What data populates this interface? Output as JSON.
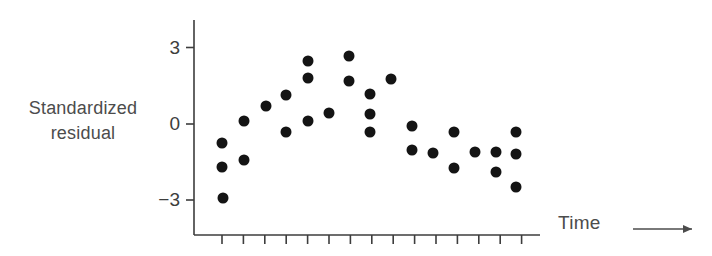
{
  "figure": {
    "background_color": "#ffffff",
    "ink_color": "#141414",
    "text_color": "#4c4c4c",
    "axis_color": "#3d3d3d",
    "ylabel_line1": "Standardized",
    "ylabel_line2": "residual",
    "xlabel": "Time",
    "arrow_icon": "right-arrow-icon"
  },
  "axes": {
    "y_ticks": [
      {
        "label": "3",
        "value": 3,
        "py": 47.5
      },
      {
        "label": "0",
        "value": 0,
        "py": 124
      },
      {
        "label": "-3",
        "value": -3,
        "py": 200
      }
    ],
    "x_tick_count": 15,
    "x_tick_first_px": 222,
    "x_tick_spacing_px": 21.4,
    "x_axis_y_px": 235,
    "y_axis_x_px": 194,
    "y_axis_top_px": 20,
    "y_axis_bottom_px": 235
  },
  "chart_data": {
    "type": "scatter",
    "title": "",
    "xlabel": "Time",
    "ylabel": "Standardized residual",
    "ylim": [
      -4.1,
      4.1
    ],
    "yticks": [
      -3,
      0,
      3
    ],
    "grid": false,
    "legend": null,
    "x_is_ordinal": true,
    "points": [
      {
        "px": 222,
        "py": 143,
        "x": 1,
        "y": -0.75
      },
      {
        "px": 222,
        "py": 167,
        "x": 1,
        "y": -1.69
      },
      {
        "px": 223,
        "py": 198,
        "x": 1,
        "y": -2.91
      },
      {
        "px": 244,
        "py": 121,
        "x": 2,
        "y": 0.12
      },
      {
        "px": 244,
        "py": 160,
        "x": 2,
        "y": -1.42
      },
      {
        "px": 266,
        "py": 106,
        "x": 3,
        "y": 0.71
      },
      {
        "px": 286,
        "py": 95,
        "x": 4,
        "y": 1.14
      },
      {
        "px": 286,
        "py": 132,
        "x": 4,
        "y": -0.31
      },
      {
        "px": 308,
        "py": 61,
        "x": 5,
        "y": 2.48
      },
      {
        "px": 308,
        "py": 78,
        "x": 5,
        "y": 1.81
      },
      {
        "px": 308,
        "py": 121,
        "x": 5,
        "y": 0.12
      },
      {
        "px": 329,
        "py": 113,
        "x": 6,
        "y": 0.43
      },
      {
        "px": 349,
        "py": 56,
        "x": 7,
        "y": 2.68
      },
      {
        "px": 349,
        "py": 81,
        "x": 7,
        "y": 1.69
      },
      {
        "px": 370,
        "py": 94,
        "x": 8,
        "y": 1.18
      },
      {
        "px": 370,
        "py": 114,
        "x": 8,
        "y": 0.39
      },
      {
        "px": 370,
        "py": 132,
        "x": 8,
        "y": -0.31
      },
      {
        "px": 391,
        "py": 79,
        "x": 9,
        "y": 1.77
      },
      {
        "px": 412,
        "py": 126,
        "x": 10,
        "y": -0.08
      },
      {
        "px": 412,
        "py": 150,
        "x": 10,
        "y": -1.02
      },
      {
        "px": 433,
        "py": 153,
        "x": 11,
        "y": -1.14
      },
      {
        "px": 454,
        "py": 132,
        "x": 12,
        "y": -0.31
      },
      {
        "px": 454,
        "py": 168,
        "x": 12,
        "y": -1.73
      },
      {
        "px": 475,
        "py": 152,
        "x": 13,
        "y": -1.1
      },
      {
        "px": 496,
        "py": 152,
        "x": 14,
        "y": -1.1
      },
      {
        "px": 496,
        "py": 172,
        "x": 14,
        "y": -1.89
      },
      {
        "px": 516,
        "py": 132,
        "x": 15,
        "y": -0.31
      },
      {
        "px": 516,
        "py": 154,
        "x": 15,
        "y": -1.18
      },
      {
        "px": 516,
        "py": 187,
        "x": 15,
        "y": -2.48
      }
    ]
  }
}
